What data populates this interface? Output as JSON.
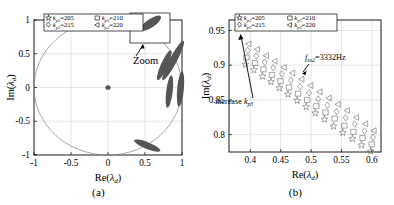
{
  "figure": {
    "panels": [
      {
        "caption": "(a)",
        "xlabel_pre": "Re(",
        "xlabel_sym": "λ",
        "xlabel_sub": "d",
        "xlabel_post": ")",
        "ylabel_pre": "Im(",
        "ylabel_sym": "λ",
        "ylabel_sub": "d",
        "ylabel_post": ")",
        "zoom_label": "Zoom"
      },
      {
        "caption": "(b)",
        "xlabel_pre": "Re(",
        "xlabel_sym": "λ",
        "xlabel_sub": "d",
        "xlabel_post": ")",
        "ylabel_pre": "Im(",
        "ylabel_sym": "λ",
        "ylabel_sub": "d",
        "ylabel_post": ")",
        "anno_increase_pre": "increase ",
        "anno_increase_sym": "k",
        "anno_increase_sub": "p3",
        "anno_freq_sym": "f",
        "anno_freq_sub": "so2",
        "anno_freq_val": "=3332Hz"
      }
    ],
    "legend": {
      "entries": [
        {
          "marker": "star-marker",
          "sym": "k",
          "sub": "p3",
          "eq": "=",
          "value": "205"
        },
        {
          "marker": "square-marker",
          "sym": "k",
          "sub": "p3",
          "eq": "=",
          "value": "210"
        },
        {
          "marker": "diamond-marker",
          "sym": "k",
          "sub": "p3",
          "eq": "=",
          "value": "215"
        },
        {
          "marker": "left-triangle-marker",
          "sym": "k",
          "sub": "p3",
          "eq": "=",
          "value": "220"
        }
      ]
    },
    "colors": {
      "axis": "#000000",
      "grid": "#cccccc",
      "marker": "#6a6a6a",
      "cluster": "#555555",
      "unit_circle": "#888888"
    }
  },
  "chart_data": [
    {
      "type": "scatter",
      "title": "(a)",
      "xlabel": "Re(λ_d)",
      "ylabel": "Im(λ_d)",
      "xlim": [
        -1.0,
        1.0
      ],
      "ylim": [
        -1.0,
        1.0
      ],
      "xticks": [
        "-1",
        "-0.5",
        "0",
        "0.5",
        "1"
      ],
      "xtick_values": [
        -1,
        -0.5,
        0,
        0.5,
        1
      ],
      "yticks": [
        "1",
        "0.5",
        "0",
        "-0.5",
        "-1"
      ],
      "ytick_values": [
        1,
        0.5,
        0,
        -0.5,
        -1
      ],
      "grid": true,
      "legend_position": "top-center",
      "annotations": [
        "Zoom"
      ],
      "unit_circle": true,
      "note": "Discrete-domain eigenvalue loci; grey unit circle drawn for stability reference.",
      "clusters": [
        {
          "name": "origin-cluster",
          "cx": 0.0,
          "cy": 0.0,
          "rx": 0.035,
          "ry": 0.035,
          "angle": 0
        },
        {
          "name": "upper-inset-cluster",
          "cx": 0.64,
          "cy": 0.93,
          "rx": 0.17,
          "ry": 0.055,
          "angle": -32
        },
        {
          "name": "upper-right-arc-outer",
          "cx": 0.88,
          "cy": 0.4,
          "rx": 0.3,
          "ry": 0.055,
          "angle": -62
        },
        {
          "name": "upper-right-arc-inner",
          "cx": 0.76,
          "cy": 0.33,
          "rx": 0.22,
          "ry": 0.05,
          "angle": -66
        },
        {
          "name": "right-arc-outer",
          "cx": 0.98,
          "cy": -0.02,
          "rx": 0.24,
          "ry": 0.05,
          "angle": -85
        },
        {
          "name": "right-arc-inner",
          "cx": 0.83,
          "cy": -0.06,
          "rx": 0.22,
          "ry": 0.048,
          "angle": -83
        },
        {
          "name": "lower-right-arc",
          "cx": 0.53,
          "cy": -0.86,
          "rx": 0.19,
          "ry": 0.05,
          "angle": 22
        }
      ]
    },
    {
      "type": "scatter",
      "title": "(b)",
      "xlabel": "Re(λ_d)",
      "ylabel": "Im(λ_d)",
      "xlim": [
        0.365,
        0.615
      ],
      "ylim": [
        0.775,
        0.965
      ],
      "xticks": [
        "0.4",
        "0.45",
        "0.5",
        "0.55",
        "0.6"
      ],
      "xtick_values": [
        0.4,
        0.45,
        0.5,
        0.55,
        0.6
      ],
      "yticks": [
        "0.95",
        "0.9",
        "0.85",
        "0.8"
      ],
      "ytick_values": [
        0.95,
        0.9,
        0.85,
        0.8
      ],
      "grid": true,
      "legend_position": "top-center",
      "annotations": [
        "increase k_p3",
        "f_so2=3332Hz"
      ],
      "note": "Zoomed view of the dominant eigenvalue band; four k_p3 settings shift the locus toward the unit circle as k_p3 increases.",
      "series": [
        {
          "name": "k_p3=220",
          "marker": "left-triangle",
          "x": [
            0.398,
            0.412,
            0.427,
            0.441,
            0.456,
            0.47,
            0.485,
            0.5,
            0.515,
            0.53,
            0.545,
            0.56,
            0.575,
            0.59,
            0.604
          ],
          "y": [
            0.931,
            0.923,
            0.914,
            0.906,
            0.897,
            0.889,
            0.88,
            0.871,
            0.862,
            0.853,
            0.844,
            0.835,
            0.825,
            0.816,
            0.806
          ]
        },
        {
          "name": "k_p3=215",
          "marker": "diamond",
          "x": [
            0.396,
            0.41,
            0.424,
            0.438,
            0.452,
            0.467,
            0.482,
            0.497,
            0.512,
            0.527,
            0.542,
            0.557,
            0.572,
            0.588,
            0.602
          ],
          "y": [
            0.921,
            0.913,
            0.904,
            0.896,
            0.887,
            0.878,
            0.869,
            0.86,
            0.851,
            0.842,
            0.833,
            0.824,
            0.815,
            0.805,
            0.796
          ]
        },
        {
          "name": "k_p3=210",
          "marker": "square",
          "x": [
            0.394,
            0.408,
            0.422,
            0.436,
            0.45,
            0.464,
            0.479,
            0.494,
            0.509,
            0.524,
            0.539,
            0.555,
            0.57,
            0.585,
            0.6
          ],
          "y": [
            0.911,
            0.903,
            0.894,
            0.886,
            0.877,
            0.868,
            0.859,
            0.85,
            0.841,
            0.832,
            0.823,
            0.813,
            0.804,
            0.795,
            0.786
          ]
        },
        {
          "name": "k_p3=205",
          "marker": "star",
          "x": [
            0.392,
            0.406,
            0.42,
            0.434,
            0.448,
            0.462,
            0.477,
            0.492,
            0.507,
            0.522,
            0.537,
            0.552,
            0.568,
            0.583,
            0.598
          ],
          "y": [
            0.901,
            0.893,
            0.884,
            0.876,
            0.867,
            0.858,
            0.849,
            0.84,
            0.831,
            0.822,
            0.812,
            0.803,
            0.794,
            0.785,
            0.776
          ]
        }
      ]
    }
  ]
}
